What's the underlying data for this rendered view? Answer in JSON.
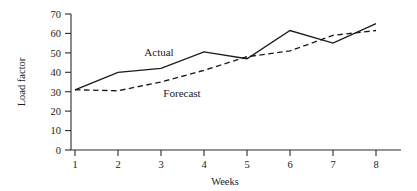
{
  "chart_data": {
    "type": "line",
    "title": "",
    "xlabel": "Weeks",
    "ylabel": "Load factor",
    "xlim": [
      1,
      8
    ],
    "ylim": [
      0,
      70
    ],
    "grid": false,
    "legend_position": "inline-labels",
    "x": [
      1,
      2,
      3,
      4,
      5,
      6,
      7,
      8
    ],
    "xtick_labels": [
      "1",
      "2",
      "3",
      "4",
      "5",
      "6",
      "7",
      "8"
    ],
    "ytick_labels": [
      "0",
      "10",
      "20",
      "30",
      "40",
      "50",
      "60",
      "70"
    ],
    "ytick_values": [
      0,
      10,
      20,
      30,
      40,
      50,
      60,
      70
    ],
    "series": [
      {
        "name": "Actual",
        "style": "solid",
        "values": [
          31,
          40,
          42,
          50.5,
          47,
          61.5,
          55,
          65
        ]
      },
      {
        "name": "Forecast",
        "style": "dashed",
        "values": [
          31,
          30.5,
          35,
          41,
          48,
          51,
          59,
          61.5
        ]
      }
    ],
    "annotations": [
      {
        "text": "Actual",
        "x": 2.9,
        "y": 52.5
      },
      {
        "text": "Forecast",
        "x": 3.35,
        "y": 31.5
      }
    ],
    "colors": {
      "axis": "#2b2b2b",
      "actual_line": "#1a1a1a",
      "forecast_line": "#1a1a1a",
      "background": "#ffffff",
      "text": "#1a1a1a"
    }
  }
}
